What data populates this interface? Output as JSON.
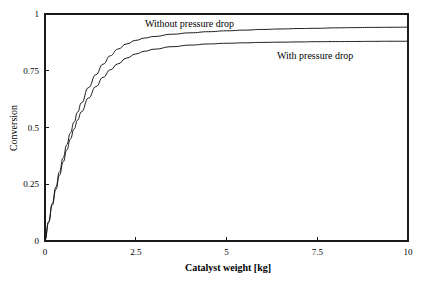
{
  "chart_data": {
    "type": "line",
    "title": "",
    "xlabel": "Catalyst weight [kg]",
    "ylabel": "Conversion",
    "xlim": [
      0,
      10
    ],
    "ylim": [
      0,
      1
    ],
    "xticks": [
      "0",
      "2.5",
      "5",
      "7.5",
      "10"
    ],
    "xtick_values": [
      0,
      2.5,
      5,
      7.5,
      10
    ],
    "yticks": [
      "0",
      "0.25",
      "0.5",
      "0.75",
      "1"
    ],
    "ytick_values": [
      0,
      0.25,
      0.5,
      0.75,
      1
    ],
    "grid": false,
    "legend": "inline-annotations",
    "line_color": "#1a1a1a",
    "background_color": "#ffffff",
    "series": [
      {
        "name": "Without pressure drop",
        "annotation": "Without pressure drop",
        "x": [
          0,
          0.1,
          0.2,
          0.3,
          0.4,
          0.5,
          0.6,
          0.7,
          0.8,
          0.9,
          1.0,
          1.2,
          1.4,
          1.6,
          1.8,
          2.0,
          2.25,
          2.5,
          2.75,
          3.0,
          3.5,
          4.0,
          4.5,
          5.0,
          5.5,
          6.0,
          6.5,
          7.0,
          7.5,
          8.0,
          8.5,
          9.0,
          9.5,
          10.0
        ],
        "values": [
          0,
          0.085,
          0.165,
          0.238,
          0.305,
          0.367,
          0.424,
          0.476,
          0.524,
          0.568,
          0.608,
          0.676,
          0.733,
          0.779,
          0.816,
          0.845,
          0.868,
          0.884,
          0.894,
          0.901,
          0.911,
          0.917,
          0.922,
          0.926,
          0.929,
          0.932,
          0.934,
          0.936,
          0.937,
          0.939,
          0.94,
          0.941,
          0.9415,
          0.942
        ]
      },
      {
        "name": "With pressure drop",
        "annotation": "With pressure drop",
        "x": [
          0,
          0.1,
          0.2,
          0.3,
          0.4,
          0.5,
          0.6,
          0.7,
          0.8,
          0.9,
          1.0,
          1.2,
          1.4,
          1.6,
          1.8,
          2.0,
          2.25,
          2.5,
          2.75,
          3.0,
          3.5,
          4.0,
          4.5,
          5.0,
          5.5,
          6.0,
          6.5,
          7.0,
          7.5,
          8.0,
          8.5,
          9.0,
          9.5,
          10.0
        ],
        "values": [
          0,
          0.082,
          0.158,
          0.227,
          0.29,
          0.348,
          0.401,
          0.449,
          0.493,
          0.533,
          0.569,
          0.63,
          0.68,
          0.721,
          0.754,
          0.78,
          0.806,
          0.824,
          0.836,
          0.845,
          0.856,
          0.863,
          0.868,
          0.871,
          0.873,
          0.875,
          0.876,
          0.877,
          0.878,
          0.8785,
          0.879,
          0.8795,
          0.88,
          0.88
        ]
      }
    ]
  }
}
